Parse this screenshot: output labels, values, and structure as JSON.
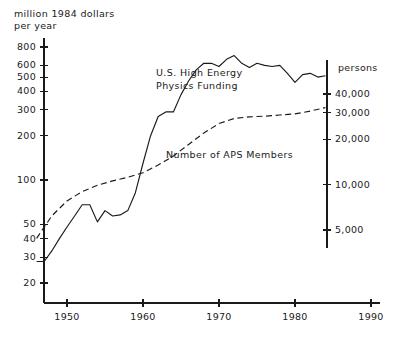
{
  "header": {
    "line1": "million 1984 dollars",
    "line2": "per year"
  },
  "right_axis_title": "persons",
  "annotations": {
    "funding": "U.S. High Energy\nPhysics Funding",
    "members": "Number of APS Members"
  },
  "chart_data": {
    "type": "line",
    "title": "",
    "subtitle": "",
    "xlabel": "",
    "ylabel": "million 1984 dollars per year",
    "y2label": "persons",
    "xlim": [
      1945,
      1991
    ],
    "grid": false,
    "legend": "inline-annotations",
    "yscale": "log",
    "y2scale": "log",
    "ylim": [
      19,
      900
    ],
    "y2lim": [
      3800,
      52000
    ],
    "xticks": [
      1950,
      1960,
      1970,
      1980,
      1990
    ],
    "xticklabels": [
      "1950",
      "1960",
      "1970",
      "1980",
      "1990"
    ],
    "yticks": [
      20,
      30,
      40,
      50,
      100,
      200,
      300,
      400,
      500,
      600,
      800
    ],
    "yticklabels": [
      "20",
      "30",
      "40",
      "50",
      "100",
      "200",
      "300",
      "400",
      "500",
      "600",
      "800"
    ],
    "y2ticks": [
      5000,
      10000,
      20000,
      30000,
      40000
    ],
    "y2ticklabels": [
      "5,000",
      "10,000",
      "20,000",
      "30,000",
      "40,000"
    ],
    "series": [
      {
        "name": "U.S. High Energy Physics Funding",
        "axis": "left",
        "style": "solid",
        "units": "million 1984 dollars per year",
        "x": [
          1946,
          1947,
          1948,
          1949,
          1950,
          1951,
          1952,
          1953,
          1954,
          1955,
          1956,
          1957,
          1958,
          1959,
          1960,
          1961,
          1962,
          1963,
          1964,
          1965,
          1966,
          1967,
          1968,
          1969,
          1970,
          1971,
          1972,
          1973,
          1974,
          1975,
          1976,
          1977,
          1978,
          1979,
          1980,
          1981,
          1982,
          1983,
          1984
        ],
        "y": [
          28,
          28,
          33,
          40,
          48,
          57,
          68,
          68,
          52,
          62,
          57,
          58,
          62,
          82,
          130,
          200,
          270,
          290,
          290,
          380,
          470,
          560,
          620,
          620,
          590,
          660,
          700,
          620,
          580,
          620,
          600,
          590,
          600,
          530,
          460,
          520,
          530,
          500,
          510
        ]
      },
      {
        "name": "Number of APS Members",
        "axis": "right",
        "style": "dashed",
        "units": "persons",
        "x": [
          1946,
          1948,
          1950,
          1952,
          1954,
          1956,
          1958,
          1960,
          1962,
          1964,
          1966,
          1968,
          1970,
          1972,
          1974,
          1976,
          1978,
          1980,
          1982,
          1984
        ],
        "y": [
          4400,
          6200,
          7800,
          9000,
          9900,
          10600,
          11200,
          12000,
          13500,
          15500,
          18500,
          22000,
          25500,
          27500,
          28200,
          28500,
          29000,
          29500,
          30800,
          32500
        ]
      }
    ]
  },
  "geometry": {
    "left_axis_x": 44,
    "right_axis_x": 327,
    "x_axis_y": 303,
    "axis_top_y": 38,
    "x_pixels_per_year": 7.6,
    "x_origin_year": 1950,
    "x_origin_px": 67
  }
}
